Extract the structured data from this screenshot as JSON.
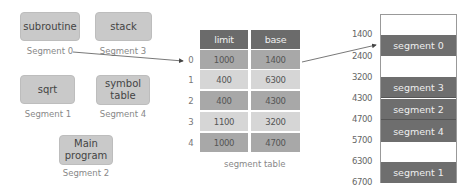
{
  "logical_segments": [
    {
      "name": "subroutine",
      "label": "Segment 0"
    },
    {
      "name": "stack",
      "label": "Segment 3"
    },
    {
      "name": "sqrt",
      "label": "Segment 1"
    },
    {
      "name_line1": "symbol",
      "name_line2": "table",
      "label": "Segment 4"
    },
    {
      "name_line1": "Main",
      "name_line2": "program",
      "label": "Segment 2"
    }
  ],
  "segment_table": {
    "headers": {
      "limit": "limit",
      "base": "base"
    },
    "rows": [
      {
        "index": "0",
        "limit": "1000",
        "base": "1400"
      },
      {
        "index": "1",
        "limit": "400",
        "base": "6300"
      },
      {
        "index": "2",
        "limit": "400",
        "base": "4300"
      },
      {
        "index": "3",
        "limit": "1100",
        "base": "3200"
      },
      {
        "index": "4",
        "limit": "1000",
        "base": "4700"
      }
    ],
    "caption": "segment table"
  },
  "physical_memory": {
    "addresses": [
      "1400",
      "2400",
      "3200",
      "4300",
      "4700",
      "5700",
      "6300",
      "6700"
    ],
    "blocks": [
      {
        "label": "segment 0"
      },
      {
        "label": "segment 3"
      },
      {
        "label": "segment 2"
      },
      {
        "label": "segment 4"
      },
      {
        "label": "segment 1"
      }
    ]
  },
  "colors": {
    "segment_box": "#c9c9c9",
    "table_header": "#6b6b6b",
    "row_dark": "#a8a8a8",
    "row_light": "#d6d6d6",
    "memory_block": "#6e6e6e"
  }
}
